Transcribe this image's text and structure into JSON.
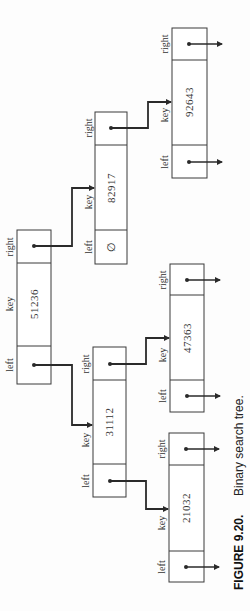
{
  "diagram": {
    "type": "binary-search-tree",
    "orientation": "rotated-90-ccw",
    "field_labels": {
      "left": "left",
      "key": "key",
      "right": "right"
    },
    "null_symbol": "∅",
    "nodes": [
      {
        "id": "n51236",
        "key": "51236",
        "left": "n31112",
        "right": "n82917"
      },
      {
        "id": "n82917",
        "key": "82917",
        "left": null,
        "left_display": "∅",
        "right": "n92643"
      },
      {
        "id": "n92643",
        "key": "92643",
        "left": "nil",
        "right": "nil"
      },
      {
        "id": "n31112",
        "key": "31112",
        "left": "n21032",
        "right": "n47363"
      },
      {
        "id": "n47363",
        "key": "47363",
        "left": "nil",
        "right": "nil"
      },
      {
        "id": "n21032",
        "key": "21032",
        "left": "nil",
        "right": "nil"
      }
    ],
    "edges": [
      {
        "from": "51236",
        "field": "right",
        "to": "82917"
      },
      {
        "from": "51236",
        "field": "left",
        "to": "31112"
      },
      {
        "from": "82917",
        "field": "right",
        "to": "92643"
      },
      {
        "from": "31112",
        "field": "right",
        "to": "47363"
      },
      {
        "from": "31112",
        "field": "left",
        "to": "21032"
      }
    ]
  },
  "caption": {
    "figure_label": "FIGURE 9.20.",
    "text": "Binary search tree."
  },
  "colors": {
    "line": "#2a2a2a",
    "box_border": "#3a3a3a",
    "background": "#fdfdfd"
  }
}
